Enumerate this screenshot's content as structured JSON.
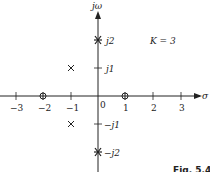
{
  "diagram": {
    "type": "s-plane pole-zero / root locus plot",
    "axes": {
      "real_label": "σ",
      "imag_label": "jω",
      "real_ticks": [
        "−3",
        "−2",
        "−1",
        "0",
        "1",
        "2",
        "3"
      ],
      "imag_ticks": [
        "j2",
        "j1",
        "−j1",
        "−j2"
      ]
    },
    "annotation": "K = 3",
    "figure_caption": "Fig. 5.4",
    "poles": [
      {
        "re": -1,
        "im": 1,
        "symbol": "×"
      },
      {
        "re": -1,
        "im": -1,
        "symbol": "×"
      }
    ],
    "zeros": [
      {
        "re": -2,
        "im": 0,
        "symbol": "⊕"
      },
      {
        "re": 1,
        "im": 0,
        "symbol": "⊕"
      }
    ],
    "closed_loop_roots": [
      {
        "re": 0,
        "im": 2,
        "symbol": "✱"
      },
      {
        "re": 0,
        "im": -2,
        "symbol": "✱"
      }
    ],
    "colors": {
      "ink": "#222222",
      "background": "#ffffff"
    }
  }
}
